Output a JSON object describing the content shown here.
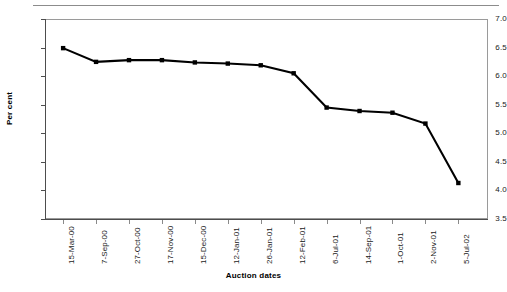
{
  "chart_data": {
    "type": "line",
    "title": "",
    "subtitle": "",
    "xlabel": "Auction dates",
    "ylabel": "Per cent",
    "categories": [
      "15-Mar-00",
      "7-Sep-00",
      "27-Oct-00",
      "17-Nov-00",
      "15-Dec-00",
      "12-Jan-01",
      "26-Jan-01",
      "12-Feb-01",
      "6-Jul-01",
      "14-Sep-01",
      "1-Oct-01",
      "2-Nov-01",
      "5-Jul-02"
    ],
    "values": [
      6.49,
      6.25,
      6.28,
      6.28,
      6.24,
      6.22,
      6.19,
      6.05,
      5.45,
      5.39,
      5.36,
      5.17,
      4.13
    ],
    "series": [
      {
        "name": "Cut-off yield",
        "values": [
          6.49,
          6.25,
          6.28,
          6.28,
          6.24,
          6.22,
          6.19,
          6.05,
          5.45,
          5.39,
          5.36,
          5.17,
          4.13
        ]
      }
    ],
    "ylim": [
      3.5,
      7.0
    ],
    "ytick_labels": [
      "7.0",
      "6.5",
      "6.0",
      "5.5",
      "5.0",
      "4.5",
      "4.0",
      "3.5"
    ],
    "ytick_values": [
      7.0,
      6.5,
      6.0,
      5.5,
      5.0,
      4.5,
      4.0,
      3.5
    ],
    "ytick_step": 0.5,
    "grid": false,
    "legend": false,
    "legend_position": "none",
    "marker": "square",
    "line_color": "#000000",
    "marker_color": "#000000",
    "frame_color": "#9a9a9a",
    "background_color": "#ffffff"
  }
}
